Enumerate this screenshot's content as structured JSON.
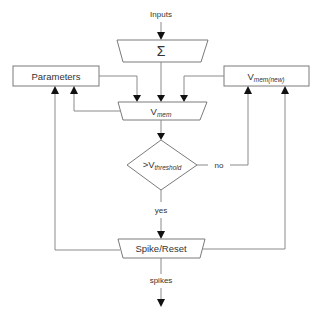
{
  "diagram": {
    "type": "flowchart",
    "title": "",
    "nodes": {
      "inputs": {
        "label": "Inputs"
      },
      "sum": {
        "label": "Σ",
        "shape": "trapezoid"
      },
      "parameters": {
        "label": "Parameters",
        "shape": "rectangle"
      },
      "vmem": {
        "label_main": "V",
        "label_sub": "mem",
        "shape": "trapezoid"
      },
      "vmem_new": {
        "label_main": "V",
        "label_sub": "mem(new)",
        "shape": "rectangle"
      },
      "threshold": {
        "label_main": ">V",
        "label_sub": "threshold",
        "shape": "diamond"
      },
      "spike_reset": {
        "label": "Spike/Reset",
        "shape": "trapezoid"
      },
      "spikes": {
        "label": "spikes"
      }
    },
    "edge_labels": {
      "no": "no",
      "yes": "yes"
    },
    "edges": [
      {
        "from": "inputs",
        "to": "sum"
      },
      {
        "from": "sum",
        "to": "vmem"
      },
      {
        "from": "parameters",
        "to": "vmem"
      },
      {
        "from": "vmem_new",
        "to": "vmem"
      },
      {
        "from": "vmem",
        "to": "parameters"
      },
      {
        "from": "vmem",
        "to": "threshold"
      },
      {
        "from": "threshold",
        "to": "vmem_new",
        "label": "no"
      },
      {
        "from": "threshold",
        "to": "spike_reset",
        "label": "yes"
      },
      {
        "from": "spike_reset",
        "to": "parameters"
      },
      {
        "from": "spike_reset",
        "to": "vmem_new"
      },
      {
        "from": "spike_reset",
        "to": "spikes"
      }
    ],
    "colors": {
      "stroke": "#7a7a7a",
      "arrowhead": "#111111",
      "text": "#333333"
    }
  }
}
